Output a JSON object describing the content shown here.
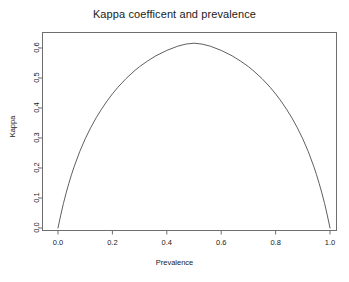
{
  "chart_data": {
    "type": "line",
    "title": "Kappa coefficent and prevalence",
    "xlabel": "Prevalence",
    "ylabel": "Kappa",
    "xlim": [
      0.0,
      1.0
    ],
    "ylim": [
      0.0,
      0.6648
    ],
    "grid": false,
    "legend": null,
    "xticks": [
      "0.0",
      "0.2",
      "0.4",
      "0.6",
      "0.8",
      "1.0"
    ],
    "xtick_values": [
      0.0,
      0.2,
      0.4,
      0.6,
      0.8,
      1.0
    ],
    "yticks": [
      "0.0",
      "0.1",
      "0.2",
      "0.3",
      "0.4",
      "0.5",
      "0.6"
    ],
    "ytick_values": [
      0.0,
      0.1,
      0.2,
      0.3,
      0.4,
      0.5,
      0.6
    ],
    "series": [
      {
        "name": "Kappa",
        "color": "#4d4d4d",
        "x": [
          0.0,
          0.01,
          0.02,
          0.03,
          0.04,
          0.05,
          0.06,
          0.08,
          0.1,
          0.12,
          0.14,
          0.16,
          0.18,
          0.2,
          0.22,
          0.25,
          0.28,
          0.3,
          0.33,
          0.36,
          0.4,
          0.44,
          0.47,
          0.5,
          0.53,
          0.56,
          0.6,
          0.64,
          0.67,
          0.7,
          0.72,
          0.75,
          0.78,
          0.8,
          0.82,
          0.84,
          0.86,
          0.88,
          0.9,
          0.92,
          0.94,
          0.95,
          0.96,
          0.97,
          0.98,
          0.99,
          1.0
        ],
        "y": [
          0.0,
          0.043,
          0.082,
          0.117,
          0.149,
          0.179,
          0.206,
          0.255,
          0.297,
          0.334,
          0.367,
          0.396,
          0.423,
          0.447,
          0.469,
          0.498,
          0.523,
          0.538,
          0.557,
          0.574,
          0.592,
          0.606,
          0.613,
          0.616,
          0.613,
          0.606,
          0.592,
          0.574,
          0.557,
          0.538,
          0.523,
          0.498,
          0.469,
          0.447,
          0.423,
          0.396,
          0.367,
          0.334,
          0.297,
          0.255,
          0.206,
          0.179,
          0.149,
          0.117,
          0.082,
          0.043,
          0.0
        ],
        "peak_x": 0.5,
        "peak_y": 0.616
      }
    ]
  },
  "axes": {
    "x_ticks": [
      {
        "label": "0.0",
        "value": 0.0
      },
      {
        "label": "0.2",
        "value": 0.2
      },
      {
        "label": "0.4",
        "value": 0.4
      },
      {
        "label": "0.6",
        "value": 0.6
      },
      {
        "label": "0.8",
        "value": 0.8
      },
      {
        "label": "1.0",
        "value": 1.0
      }
    ],
    "y_ticks": [
      {
        "label": "0.0",
        "value": 0.0
      },
      {
        "label": "0.1",
        "value": 0.1
      },
      {
        "label": "0.2",
        "value": 0.2
      },
      {
        "label": "0.3",
        "value": 0.3
      },
      {
        "label": "0.4",
        "value": 0.4
      },
      {
        "label": "0.5",
        "value": 0.5
      },
      {
        "label": "0.6",
        "value": 0.6
      }
    ]
  },
  "style": {
    "axis_color": "#6e6e6e",
    "curve_color": "#4d4d4d",
    "text_color": "#1a1a1a",
    "background": "#ffffff"
  }
}
